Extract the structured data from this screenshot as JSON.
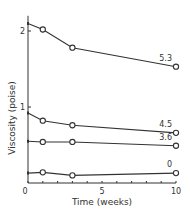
{
  "chart_data": {
    "type": "line",
    "title": "",
    "xlabel": "Time (weeks)",
    "ylabel": "Viscosity (poise)",
    "xlim": [
      0,
      10
    ],
    "ylim": [
      0,
      2.2
    ],
    "x_ticks": [
      0,
      5,
      10
    ],
    "x_minor_ticks": [
      1,
      2,
      3,
      4,
      6,
      7,
      8,
      9
    ],
    "y_ticks": [
      0,
      1,
      2
    ],
    "grid": false,
    "legend": "inline labels at right end of each line",
    "series": [
      {
        "name": "5.3",
        "x": [
          0,
          1,
          3,
          10
        ],
        "values": [
          2.1,
          2.02,
          1.78,
          1.53
        ]
      },
      {
        "name": "4.5",
        "x": [
          0,
          1,
          3,
          10
        ],
        "values": [
          0.92,
          0.82,
          0.76,
          0.66
        ]
      },
      {
        "name": "3.6",
        "x": [
          0,
          1,
          3,
          10
        ],
        "values": [
          0.55,
          0.54,
          0.54,
          0.49
        ]
      },
      {
        "name": "0",
        "x": [
          0,
          1,
          3,
          10
        ],
        "values": [
          0.13,
          0.14,
          0.1,
          0.13
        ]
      }
    ]
  },
  "colors": {
    "line": "#333333",
    "marker_fill": "#ffffff",
    "background": "#ffffff"
  }
}
